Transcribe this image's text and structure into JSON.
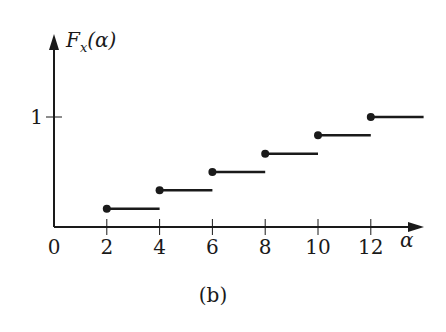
{
  "chart_data": {
    "type": "line",
    "subtype": "step-cdf",
    "title": "",
    "ylabel": "F_x(α)",
    "ylabel_main": "F",
    "ylabel_sub": "x",
    "ylabel_arg": "(α)",
    "xlabel": "α",
    "caption": "(b)",
    "xlim": [
      0,
      14
    ],
    "ylim": [
      0,
      1
    ],
    "x_ticks": [
      0,
      2,
      4,
      6,
      8,
      10,
      12
    ],
    "x_tick_labels": [
      "0",
      "2",
      "4",
      "6",
      "8",
      "10",
      "12"
    ],
    "y_ticks": [
      1
    ],
    "y_tick_labels": [
      "1"
    ],
    "steps": [
      {
        "x_start": 2,
        "x_end": 4,
        "y": 0.1667
      },
      {
        "x_start": 4,
        "x_end": 6,
        "y": 0.3333
      },
      {
        "x_start": 6,
        "x_end": 8,
        "y": 0.5
      },
      {
        "x_start": 8,
        "x_end": 10,
        "y": 0.6667
      },
      {
        "x_start": 10,
        "x_end": 12,
        "y": 0.8333
      },
      {
        "x_start": 12,
        "x_end": 14,
        "y": 1.0
      }
    ],
    "grid": false,
    "legend": null
  }
}
